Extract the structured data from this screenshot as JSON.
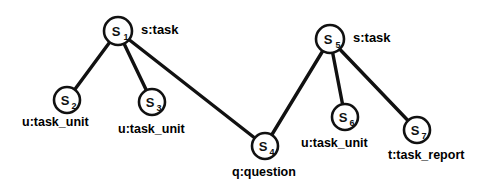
{
  "diagram": {
    "type": "node-link-graph",
    "background_color": "#ffffff",
    "stroke_color": "#111111",
    "node_fill": "#ffffff",
    "nodes": [
      {
        "id": "S1",
        "glyph": "S",
        "subscript": "1",
        "label": "s:task",
        "cx": 118,
        "cy": 31,
        "r": 14,
        "label_x": 141,
        "label_y": 22
      },
      {
        "id": "S2",
        "glyph": "S",
        "subscript": "2",
        "label": "u:task_unit",
        "cx": 67,
        "cy": 100,
        "r": 13,
        "label_x": 22,
        "label_y": 115
      },
      {
        "id": "S3",
        "glyph": "S",
        "subscript": "3",
        "label": "u:task_unit",
        "cx": 152,
        "cy": 102,
        "r": 13,
        "label_x": 118,
        "label_y": 122
      },
      {
        "id": "S4",
        "glyph": "S",
        "subscript": "4",
        "label": "q:question",
        "cx": 265,
        "cy": 146,
        "r": 13,
        "label_x": 232,
        "label_y": 165
      },
      {
        "id": "S5",
        "glyph": "S",
        "subscript": "5",
        "label": "s:task",
        "cx": 330,
        "cy": 39,
        "r": 14,
        "label_x": 353,
        "label_y": 30
      },
      {
        "id": "S6",
        "glyph": "S",
        "subscript": "6",
        "label": "u:task_unit",
        "cx": 345,
        "cy": 117,
        "r": 13,
        "label_x": 301,
        "label_y": 136
      },
      {
        "id": "S7",
        "glyph": "S",
        "subscript": "7",
        "label": "t:task_report",
        "cx": 417,
        "cy": 130,
        "r": 13,
        "label_x": 388,
        "label_y": 148
      }
    ],
    "edges": [
      {
        "id": "e1",
        "from": "S1",
        "to": "S2"
      },
      {
        "id": "e2",
        "from": "S1",
        "to": "S3"
      },
      {
        "id": "e3",
        "from": "S1",
        "to": "S4"
      },
      {
        "id": "e4",
        "from": "S5",
        "to": "S4"
      },
      {
        "id": "e5",
        "from": "S5",
        "to": "S6"
      },
      {
        "id": "e6",
        "from": "S5",
        "to": "S7"
      }
    ]
  }
}
